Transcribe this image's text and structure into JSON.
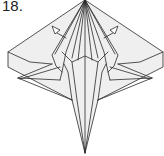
{
  "diagram": {
    "step_label": "18.",
    "colors": {
      "paper": "#efefef",
      "line": "#2a2a2a",
      "background": "#ffffff"
    },
    "arrows": [
      {
        "name": "left-push-arrow",
        "direction": "up-left"
      },
      {
        "name": "right-push-arrow",
        "direction": "up-right"
      }
    ]
  }
}
